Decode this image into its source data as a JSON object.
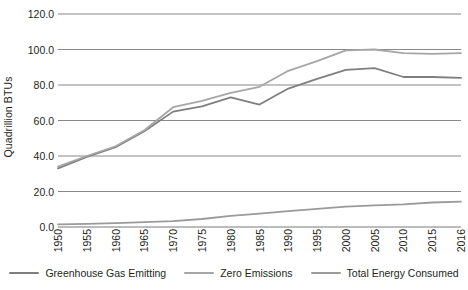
{
  "chart_data": {
    "type": "line",
    "title": "",
    "xlabel": "",
    "ylabel": "Quadrillion BTUs",
    "ylim": [
      0,
      120
    ],
    "yticks": [
      "0.0",
      "20.0",
      "40.0",
      "60.0",
      "80.0",
      "100.0",
      "120.0"
    ],
    "ytick_values": [
      0,
      20,
      40,
      60,
      80,
      100,
      120
    ],
    "grid": true,
    "legend_position": "bottom",
    "categories": [
      "1950",
      "1955",
      "1960",
      "1965",
      "1970",
      "1975",
      "1980",
      "1985",
      "1990",
      "1995",
      "2000",
      "2005",
      "2010",
      "2015",
      "2016"
    ],
    "series": [
      {
        "name": "Greenhouse Gas Emitting",
        "color": "#7f7f7f",
        "values": [
          33.0,
          39.5,
          45.0,
          54.0,
          65.0,
          68.0,
          73.0,
          69.0,
          78.0,
          83.5,
          88.5,
          89.5,
          84.5,
          84.5,
          84.0
        ]
      },
      {
        "name": "Zero Emissions",
        "color": "#a6a6a6",
        "values": [
          34.0,
          40.0,
          45.5,
          54.5,
          67.5,
          71.0,
          75.5,
          79.0,
          88.0,
          93.5,
          99.5,
          100.0,
          98.0,
          97.5,
          98.0
        ]
      },
      {
        "name": "Total Energy Consumed",
        "color": "#9a9a9a",
        "values": [
          1.5,
          1.8,
          2.2,
          2.7,
          3.3,
          4.5,
          6.3,
          7.5,
          9.0,
          10.2,
          11.5,
          12.2,
          12.8,
          13.8,
          14.3
        ]
      }
    ]
  },
  "legend": {
    "items": [
      {
        "label": "Greenhouse Gas Emitting",
        "color": "#7f7f7f"
      },
      {
        "label": "Zero Emissions",
        "color": "#a6a6a6"
      },
      {
        "label": "Total Energy Consumed",
        "color": "#9a9a9a"
      }
    ]
  },
  "colors": {
    "axis": "#595959",
    "gridline": "#7a7a7a",
    "text": "#231f20",
    "background": "#ffffff"
  }
}
